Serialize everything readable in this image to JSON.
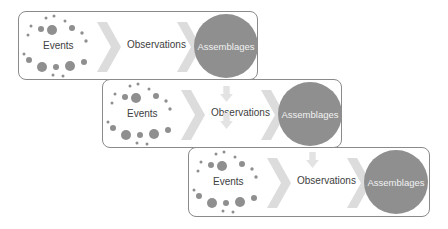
{
  "diagram": {
    "type": "process-flow-stack",
    "colors": {
      "dot": "#8f8f8f",
      "chevron": "#dcdcdc",
      "circle": "#8f8f8f",
      "circle_text": "#f2f2f2",
      "panel_border": "#8a8a8a",
      "down_arrow": "#e3e3e3",
      "text": "#404040"
    },
    "panels": [
      {
        "events_label": "Events",
        "observations_label": "Observations",
        "assemblages_label": "Assemblages"
      },
      {
        "events_label": "Events",
        "observations_label": "Observations",
        "assemblages_label": "Assemblages"
      },
      {
        "events_label": "Events",
        "observations_label": "Observations",
        "assemblages_label": "Assemblages"
      }
    ],
    "icons": {
      "dots": "scattered-dots-cluster-icon",
      "chevron": "chevron-right-icon",
      "down_arrow": "arrow-down-icon"
    }
  }
}
